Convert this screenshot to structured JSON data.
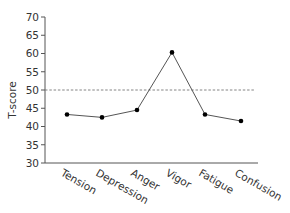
{
  "chart_data": {
    "type": "line",
    "title": "",
    "xlabel": "",
    "ylabel": "T-score",
    "categories": [
      "Tension",
      "Depression",
      "Anger",
      "Vigor",
      "Fatigue",
      "Confusion"
    ],
    "series": [
      {
        "name": "T-score",
        "values": [
          43.3,
          42.5,
          44.5,
          60.3,
          43.3,
          41.5
        ]
      }
    ],
    "ylim": [
      30,
      70
    ],
    "yticks": [
      30,
      35,
      40,
      45,
      50,
      55,
      60,
      65,
      70
    ],
    "reference_line": {
      "y": 50,
      "style": "dashed"
    },
    "grid": false,
    "legend": "none",
    "x_label_rotation": 30
  },
  "colors": {
    "line": "#555555",
    "marker": "#000000",
    "axis": "#555555",
    "reference": "#777777"
  }
}
